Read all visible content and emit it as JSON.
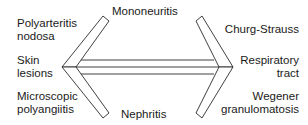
{
  "diagram": {
    "type": "double-headed-arrow-relationship",
    "left_labels": [
      {
        "id": "polyarteritis-nodosa",
        "lines": [
          "Polyarteritis",
          "nodosa"
        ]
      },
      {
        "id": "skin-lesions",
        "lines": [
          "Skin",
          "lesions"
        ]
      },
      {
        "id": "microscopic-polyangiitis",
        "lines": [
          "Microscopic",
          "polyangiitis"
        ]
      }
    ],
    "right_labels": [
      {
        "id": "churg-strauss",
        "lines": [
          "Churg-Strauss"
        ]
      },
      {
        "id": "respiratory-tract",
        "lines": [
          "Respiratory",
          "tract"
        ]
      },
      {
        "id": "wegener-granulomatosis",
        "lines": [
          "Wegener",
          "granulomatosis"
        ]
      }
    ],
    "top_label": {
      "id": "mononeuritis",
      "lines": [
        "Mononeuritis"
      ]
    },
    "bottom_label": {
      "id": "nephritis",
      "lines": [
        "Nephritis"
      ]
    },
    "colors": {
      "stroke": "#2a2a2a",
      "text": "#1a1a1a",
      "background": "#ffffff"
    }
  }
}
